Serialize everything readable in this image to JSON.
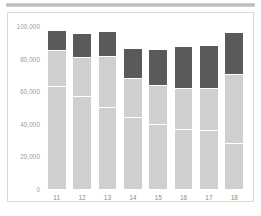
{
  "chart_data": {
    "type": "bar",
    "stacked": true,
    "title": "",
    "subtitle": "",
    "xlabel": "",
    "ylabel": "",
    "categories": [
      "11",
      "12",
      "13",
      "14",
      "15",
      "16",
      "17",
      "18"
    ],
    "ylim": [
      0,
      100000
    ],
    "yticks": [
      0,
      20000,
      40000,
      60000,
      80000,
      100000
    ],
    "ytick_labels": [
      "0",
      "20,000",
      "40,000",
      "60,000",
      "80,000",
      "100,000"
    ],
    "grid": false,
    "legend": "none",
    "colors": {
      "light_segment": "#cfcfcf",
      "dark_segment": "#5a5a5a",
      "axis_text": "#9a9a9a",
      "card_border": "#d9d9d9",
      "background": "#ffffff",
      "top_strip": "#c2c2c5"
    },
    "series": [
      {
        "name": "segment-1",
        "color": "#cfcfcf",
        "values": [
          50500,
          42500,
          35000,
          24000,
          19500,
          17000,
          17500,
          12500
        ]
      },
      {
        "name": "segment-2",
        "color": "#cfcfcf",
        "values": [
          12500,
          14500,
          15500,
          20000,
          20500,
          20000,
          18500,
          15500
        ]
      },
      {
        "name": "segment-3",
        "color": "#cfcfcf",
        "values": [
          22000,
          24000,
          31000,
          24000,
          24000,
          25000,
          26000,
          42500
        ]
      },
      {
        "name": "segment-4",
        "color": "#5a5a5a",
        "values": [
          12000,
          14000,
          15000,
          18000,
          21500,
          25000,
          26000,
          25000
        ]
      }
    ],
    "bar_totals": [
      97000,
      95000,
      96500,
      86000,
      85500,
      87000,
      88000,
      95500
    ],
    "bars": [
      {
        "category": "11",
        "total": 97000,
        "light_total": 85000,
        "dark_total": 12000,
        "light_segments": [
          50500,
          12500,
          22000
        ]
      },
      {
        "category": "12",
        "total": 95000,
        "light_total": 81000,
        "dark_total": 14000,
        "light_segments": [
          42500,
          14500,
          24000
        ]
      },
      {
        "category": "13",
        "total": 96500,
        "light_total": 81500,
        "dark_total": 15000,
        "light_segments": [
          35000,
          15500,
          31000
        ]
      },
      {
        "category": "14",
        "total": 86000,
        "light_total": 68000,
        "dark_total": 18000,
        "light_segments": [
          24000,
          20000,
          24000
        ]
      },
      {
        "category": "15",
        "total": 85500,
        "light_total": 64000,
        "dark_total": 21500,
        "light_segments": [
          19500,
          20500,
          24000
        ]
      },
      {
        "category": "16",
        "total": 87000,
        "light_total": 62000,
        "dark_total": 25000,
        "light_segments": [
          17000,
          20000,
          25000
        ]
      },
      {
        "category": "17",
        "total": 88000,
        "light_total": 62000,
        "dark_total": 26000,
        "light_segments": [
          17500,
          18500,
          26000
        ]
      },
      {
        "category": "18",
        "total": 95500,
        "light_total": 70500,
        "dark_total": 25000,
        "light_segments": [
          12500,
          15500,
          42500
        ]
      }
    ]
  }
}
